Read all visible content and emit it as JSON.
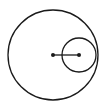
{
  "diagram": {
    "background": "#ffffff",
    "stroke_color": "#1a1a1a",
    "big_circle": {
      "cx": 53,
      "cy": 55,
      "r": 45
    },
    "small_circle": {
      "cx": 79,
      "cy": 55,
      "r": 17
    },
    "segment": {
      "x1": 53,
      "y1": 55,
      "x2": 79,
      "y2": 55
    },
    "points": [
      {
        "name": "big-center",
        "x": 53,
        "y": 55
      },
      {
        "name": "small-center",
        "x": 79,
        "y": 55
      }
    ]
  }
}
